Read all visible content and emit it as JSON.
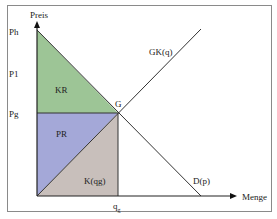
{
  "diagram": {
    "type": "supply-demand-surplus",
    "axes": {
      "y_label": "Preis",
      "x_label": "Menge"
    },
    "price_ticks": [
      "Ph",
      "P1",
      "Pg"
    ],
    "quantity_ticks": {
      "qg": {
        "main": "q",
        "sub": "g"
      }
    },
    "curves": {
      "supply": "GK(q)",
      "demand": "D(p)"
    },
    "point": "G",
    "areas": {
      "consumer_surplus": {
        "label": "KR",
        "color": "#9dc596"
      },
      "producer_surplus": {
        "label": "PR",
        "color": "#a4a8d8"
      },
      "cost": {
        "label": "K(qg)",
        "color": "#c8bfbb"
      }
    }
  }
}
